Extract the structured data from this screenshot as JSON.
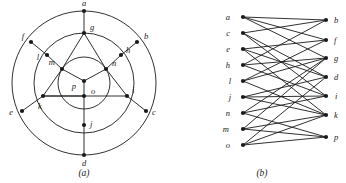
{
  "figure": {
    "panels": [
      {
        "id": "a",
        "caption": "(a)",
        "caption_x": 84,
        "caption_y": 176
      },
      {
        "id": "b",
        "caption": "(b)",
        "caption_x": 262,
        "caption_y": 176
      }
    ]
  },
  "panel_a": {
    "center": {
      "x": 84,
      "y": 83
    },
    "radii": {
      "outer": 72,
      "middle": 50,
      "inner": 26
    },
    "rings": [
      {
        "name": "outer-circle",
        "r": 72
      },
      {
        "name": "middle-circle",
        "r": 50
      },
      {
        "name": "inner-circle",
        "r": 26
      }
    ],
    "vertices": [
      {
        "id": "a",
        "x": 84,
        "y": 11,
        "lx": 84,
        "ly": 6,
        "anchor": "middle",
        "ring": "outer"
      },
      {
        "id": "b",
        "x": 137,
        "y": 42,
        "lx": 144,
        "ly": 39,
        "anchor": "start",
        "ring": "outer"
      },
      {
        "id": "c",
        "x": 146,
        "y": 111,
        "lx": 152,
        "ly": 115,
        "anchor": "start",
        "ring": "outer"
      },
      {
        "id": "d",
        "x": 84,
        "y": 155,
        "lx": 84,
        "ly": 166,
        "anchor": "middle",
        "ring": "outer"
      },
      {
        "id": "e",
        "x": 22,
        "y": 111,
        "lx": 13,
        "ly": 115,
        "anchor": "end",
        "ring": "outer"
      },
      {
        "id": "f",
        "x": 31,
        "y": 42,
        "lx": 24,
        "ly": 39,
        "anchor": "end",
        "ring": "outer"
      },
      {
        "id": "g",
        "x": 84,
        "y": 33,
        "lx": 90,
        "ly": 30,
        "anchor": "start",
        "ring": "middle"
      },
      {
        "id": "h",
        "x": 121,
        "y": 55,
        "lx": 126,
        "ly": 53,
        "anchor": "start",
        "ring": "middle"
      },
      {
        "id": "i",
        "x": 127,
        "y": 96,
        "lx": 132,
        "ly": 93,
        "anchor": "start",
        "ring": "middle"
      },
      {
        "id": "j",
        "x": 84,
        "y": 125,
        "lx": 90,
        "ly": 127,
        "anchor": "start",
        "ring": "middle"
      },
      {
        "id": "k",
        "x": 43,
        "y": 96,
        "lx": 40,
        "ly": 109,
        "anchor": "middle",
        "ring": "middle"
      },
      {
        "id": "l",
        "x": 47,
        "y": 55,
        "lx": 38,
        "ly": 60,
        "anchor": "middle",
        "ring": "middle"
      },
      {
        "id": "m",
        "x": 62,
        "y": 69,
        "lx": 55,
        "ly": 65,
        "anchor": "end",
        "ring": "inner"
      },
      {
        "id": "n",
        "x": 106,
        "y": 69,
        "lx": 112,
        "ly": 66,
        "anchor": "start",
        "ring": "inner"
      },
      {
        "id": "p",
        "x": 84,
        "y": 81,
        "lx": 76,
        "ly": 89,
        "anchor": "end",
        "ring": "inner"
      },
      {
        "id": "o",
        "x": 84,
        "y": 96,
        "lx": 91,
        "ly": 94,
        "anchor": "start",
        "ring": "center"
      }
    ],
    "straight_edges": [
      [
        "a",
        "g"
      ],
      [
        "b",
        "h"
      ],
      [
        "c",
        "i"
      ],
      [
        "d",
        "j"
      ],
      [
        "e",
        "k"
      ],
      [
        "f",
        "l"
      ],
      [
        "g",
        "m"
      ],
      [
        "g",
        "n"
      ],
      [
        "h",
        "n"
      ],
      [
        "i",
        "n"
      ],
      [
        "i",
        "k"
      ],
      [
        "j",
        "o"
      ],
      [
        "k",
        "m"
      ],
      [
        "k",
        "o"
      ],
      [
        "l",
        "m"
      ],
      [
        "m",
        "p"
      ],
      [
        "n",
        "p"
      ],
      [
        "o",
        "p"
      ]
    ],
    "arc_edges": [
      {
        "from": "a",
        "to": "b",
        "ring": "outer"
      },
      {
        "from": "b",
        "to": "c",
        "ring": "outer"
      },
      {
        "from": "c",
        "to": "d",
        "ring": "outer"
      },
      {
        "from": "d",
        "to": "e",
        "ring": "outer"
      },
      {
        "from": "e",
        "to": "f",
        "ring": "outer"
      },
      {
        "from": "f",
        "to": "a",
        "ring": "outer"
      },
      {
        "from": "g",
        "to": "h",
        "ring": "middle"
      },
      {
        "from": "h",
        "to": "i",
        "ring": "middle"
      },
      {
        "from": "i",
        "to": "j",
        "ring": "middle"
      },
      {
        "from": "j",
        "to": "k",
        "ring": "middle"
      },
      {
        "from": "k",
        "to": "l",
        "ring": "middle"
      },
      {
        "from": "l",
        "to": "g",
        "ring": "middle"
      }
    ]
  },
  "panel_b": {
    "left_x": 243,
    "right_x": 326,
    "left_nodes": [
      {
        "id": "a",
        "y": 17,
        "lx": 230,
        "ly": 20
      },
      {
        "id": "c",
        "y": 33,
        "lx": 230,
        "ly": 36
      },
      {
        "id": "e",
        "y": 49,
        "lx": 230,
        "ly": 52
      },
      {
        "id": "h",
        "y": 65,
        "lx": 230,
        "ly": 68
      },
      {
        "id": "l",
        "y": 81,
        "lx": 231,
        "ly": 84
      },
      {
        "id": "j",
        "y": 97,
        "lx": 231,
        "ly": 100
      },
      {
        "id": "n",
        "y": 113,
        "lx": 230,
        "ly": 116
      },
      {
        "id": "m",
        "y": 129,
        "lx": 229,
        "ly": 132
      },
      {
        "id": "o",
        "y": 145,
        "lx": 230,
        "ly": 148
      }
    ],
    "right_nodes": [
      {
        "id": "b",
        "y": 20,
        "lx": 334,
        "ly": 23
      },
      {
        "id": "f",
        "y": 40,
        "lx": 334,
        "ly": 43
      },
      {
        "id": "g",
        "y": 58,
        "lx": 334,
        "ly": 61
      },
      {
        "id": "d",
        "y": 77,
        "lx": 334,
        "ly": 80
      },
      {
        "id": "i",
        "y": 96,
        "lx": 335,
        "ly": 99
      },
      {
        "id": "k",
        "y": 115,
        "lx": 334,
        "ly": 118
      },
      {
        "id": "p",
        "y": 137,
        "lx": 334,
        "ly": 140
      }
    ],
    "edges": [
      [
        "a",
        "b"
      ],
      [
        "a",
        "f"
      ],
      [
        "a",
        "g"
      ],
      [
        "c",
        "b"
      ],
      [
        "c",
        "d"
      ],
      [
        "c",
        "i"
      ],
      [
        "e",
        "f"
      ],
      [
        "e",
        "d"
      ],
      [
        "e",
        "k"
      ],
      [
        "h",
        "b"
      ],
      [
        "h",
        "g"
      ],
      [
        "h",
        "i"
      ],
      [
        "l",
        "f"
      ],
      [
        "l",
        "g"
      ],
      [
        "l",
        "k"
      ],
      [
        "j",
        "d"
      ],
      [
        "j",
        "i"
      ],
      [
        "j",
        "k"
      ],
      [
        "n",
        "g"
      ],
      [
        "n",
        "i"
      ],
      [
        "n",
        "p"
      ],
      [
        "m",
        "g"
      ],
      [
        "m",
        "k"
      ],
      [
        "m",
        "p"
      ],
      [
        "o",
        "d"
      ],
      [
        "o",
        "k"
      ],
      [
        "o",
        "p"
      ]
    ]
  },
  "style": {
    "ink": "#1a1a1a",
    "background": "#ffffff",
    "node_radius": 2.1,
    "edge_width": 0.9,
    "ring_width": 0.9
  }
}
